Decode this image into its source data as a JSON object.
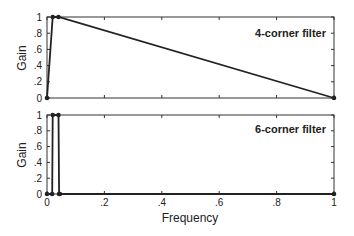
{
  "chart_data": [
    {
      "type": "line",
      "title": "4-corner filter",
      "xlabel": "",
      "ylabel": "Gain",
      "xlim": [
        0,
        1
      ],
      "ylim": [
        0,
        1
      ],
      "grid": false,
      "x": [
        0,
        0.02,
        0.04,
        1
      ],
      "y": [
        0,
        1,
        1,
        0
      ],
      "yticks": [
        "0",
        ".2",
        ".4",
        ".6",
        ".8",
        "1"
      ],
      "xticks": []
    },
    {
      "type": "line",
      "title": "6-corner filter",
      "xlabel": "Frequency",
      "ylabel": "Gain",
      "xlim": [
        0,
        1
      ],
      "ylim": [
        0,
        1
      ],
      "grid": false,
      "x": [
        0,
        0.018,
        0.02,
        0.04,
        0.042,
        0.045,
        1
      ],
      "y": [
        0,
        0,
        1,
        1,
        0,
        0,
        0
      ],
      "yticks": [
        "0",
        ".2",
        ".4",
        ".6",
        ".8",
        "1"
      ],
      "xticks": [
        "0",
        ".2",
        ".4",
        ".6",
        ".8",
        "1"
      ]
    }
  ],
  "labels": {
    "top_title": "4-corner filter",
    "bottom_title": "6-corner filter",
    "ylabel_top": "Gain",
    "ylabel_bottom": "Gain",
    "xlabel": "Frequency"
  },
  "colors": {
    "line": "#222222",
    "axis": "#333333"
  }
}
